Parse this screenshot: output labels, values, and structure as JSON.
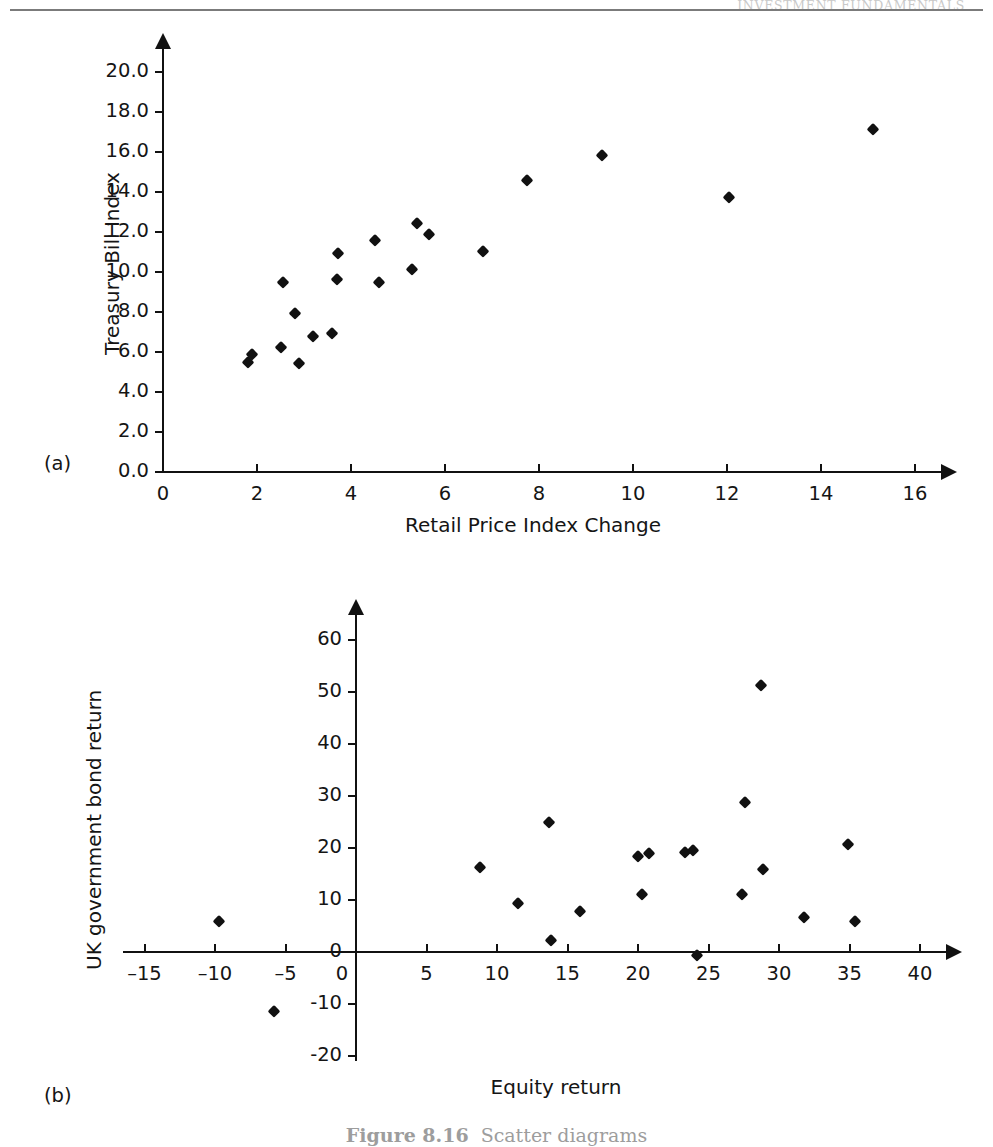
{
  "page": {
    "running_head": "INVESTMENT FUNDAMENTALS",
    "caption_label": "Figure 8.16",
    "caption_text": "Scatter diagrams"
  },
  "charts": [
    {
      "panel_letter": "(a)",
      "chart_data": {
        "type": "scatter",
        "title": "",
        "xlabel": "Retail Price Index Change",
        "ylabel": "Treasury Bill Index",
        "xlim": [
          0,
          16.6
        ],
        "ylim": [
          0,
          21.2
        ],
        "xticks": [
          "0",
          "2",
          "4",
          "6",
          "8",
          "10",
          "12",
          "14",
          "16"
        ],
        "xtick_values": [
          0,
          2,
          4,
          6,
          8,
          10,
          12,
          14,
          16
        ],
        "yticks": [
          "0.0",
          "2.0",
          "4.0",
          "6.0",
          "8.0",
          "10.0",
          "12.0",
          "14.0",
          "16.0",
          "18.0",
          "20.0"
        ],
        "ytick_values": [
          0,
          2,
          4,
          6,
          8,
          10,
          12,
          14,
          16,
          18,
          20
        ],
        "grid": false,
        "legend": "none",
        "points": [
          {
            "x": 1.8,
            "y": 5.5
          },
          {
            "x": 1.9,
            "y": 5.9
          },
          {
            "x": 2.5,
            "y": 6.25
          },
          {
            "x": 2.55,
            "y": 9.5
          },
          {
            "x": 2.8,
            "y": 7.95
          },
          {
            "x": 2.9,
            "y": 5.45
          },
          {
            "x": 3.2,
            "y": 6.8
          },
          {
            "x": 3.6,
            "y": 6.95
          },
          {
            "x": 3.7,
            "y": 9.65
          },
          {
            "x": 3.72,
            "y": 10.95
          },
          {
            "x": 4.5,
            "y": 11.6
          },
          {
            "x": 4.6,
            "y": 9.5
          },
          {
            "x": 5.3,
            "y": 10.15
          },
          {
            "x": 5.4,
            "y": 12.45
          },
          {
            "x": 5.65,
            "y": 11.9
          },
          {
            "x": 6.8,
            "y": 11.05
          },
          {
            "x": 7.75,
            "y": 14.6
          },
          {
            "x": 9.35,
            "y": 15.85
          },
          {
            "x": 12.05,
            "y": 13.75
          },
          {
            "x": 15.1,
            "y": 17.15
          }
        ]
      }
    },
    {
      "panel_letter": "(b)",
      "chart_data": {
        "type": "scatter",
        "title": "",
        "xlabel": "Equity return",
        "ylabel": "UK government bond return",
        "xlim": [
          -16.5,
          42
        ],
        "ylim": [
          -21,
          65
        ],
        "xticks": [
          "-15",
          "-10",
          "-5",
          "0",
          "5",
          "10",
          "15",
          "20",
          "25",
          "30",
          "35",
          "40"
        ],
        "xtick_values": [
          -15,
          -10,
          -5,
          0,
          5,
          10,
          15,
          20,
          25,
          30,
          35,
          40
        ],
        "yticks": [
          "-20",
          "-10",
          "0",
          "10",
          "20",
          "30",
          "40",
          "50",
          "60"
        ],
        "ytick_values": [
          -20,
          -10,
          0,
          10,
          20,
          30,
          40,
          50,
          60
        ],
        "grid": false,
        "legend": "none",
        "points": [
          {
            "x": -9.7,
            "y": 6.0
          },
          {
            "x": -5.8,
            "y": -11.3
          },
          {
            "x": 8.8,
            "y": 16.3
          },
          {
            "x": 11.5,
            "y": 9.4
          },
          {
            "x": 13.7,
            "y": 25.0
          },
          {
            "x": 13.8,
            "y": 2.3
          },
          {
            "x": 15.9,
            "y": 7.9
          },
          {
            "x": 20.0,
            "y": 18.5
          },
          {
            "x": 20.3,
            "y": 11.1
          },
          {
            "x": 20.8,
            "y": 19.0
          },
          {
            "x": 23.3,
            "y": 19.3
          },
          {
            "x": 23.9,
            "y": 19.6
          },
          {
            "x": 24.2,
            "y": -0.6
          },
          {
            "x": 27.4,
            "y": 11.2
          },
          {
            "x": 27.6,
            "y": 28.9
          },
          {
            "x": 28.7,
            "y": 51.3
          },
          {
            "x": 28.9,
            "y": 15.9
          },
          {
            "x": 31.8,
            "y": 6.8
          },
          {
            "x": 34.9,
            "y": 20.8
          },
          {
            "x": 35.4,
            "y": 6.0
          }
        ]
      }
    }
  ]
}
